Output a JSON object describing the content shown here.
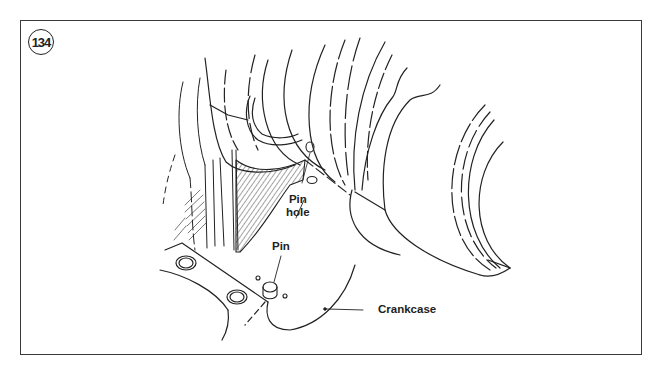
{
  "figure": {
    "number": "134",
    "labels": {
      "pin_hole": [
        "Pin",
        "hole"
      ],
      "pin": "Pin",
      "crankcase": "Crankcase"
    }
  },
  "colors": {
    "ink": "#222222",
    "frame": "#3a3a3a",
    "background": "#ffffff"
  }
}
